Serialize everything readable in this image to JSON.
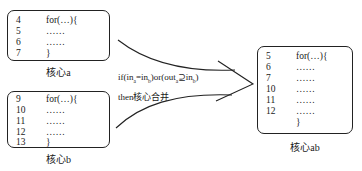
{
  "core_a": {
    "label": "核心a",
    "lines": [
      {
        "num": "4",
        "code": "for(…){"
      },
      {
        "num": "5",
        "code": "……"
      },
      {
        "num": "6",
        "code": "……"
      },
      {
        "num": "7",
        "code": "}"
      }
    ]
  },
  "core_b": {
    "label": "核心b",
    "lines": [
      {
        "num": "9",
        "code": "for(…){"
      },
      {
        "num": "10",
        "code": "……"
      },
      {
        "num": "11",
        "code": "……"
      },
      {
        "num": "12",
        "code": "……"
      },
      {
        "num": "13",
        "code": "}"
      }
    ]
  },
  "core_ab": {
    "label": "核心ab",
    "lines": [
      {
        "num": "5",
        "code": "for(…){"
      },
      {
        "num": "6",
        "code": "……"
      },
      {
        "num": "7",
        "code": "……"
      },
      {
        "num": "10",
        "code": "……"
      },
      {
        "num": "11",
        "code": "……"
      },
      {
        "num": "12",
        "code": "……"
      },
      {
        "num": "",
        "code": "}"
      }
    ]
  },
  "condition": {
    "line1_prefix": "if(in",
    "sub_a": "a",
    "eq": "=in",
    "sub_b": "b",
    "mid": ")or(out",
    "sub_a2": "a",
    "supseteq": "⊇in",
    "sub_b2": "b",
    "suffix": ")",
    "line2": "then核心合并"
  }
}
